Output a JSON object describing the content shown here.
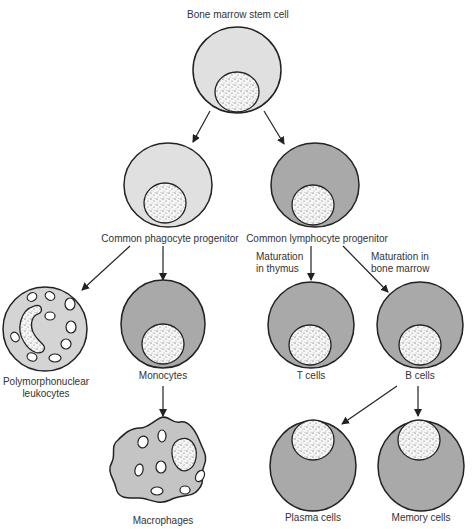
{
  "title": "Bone marrow stem cell",
  "colors": {
    "light_cell": "#e0e0e0",
    "dark_cell": "#a9a9a9",
    "outline": "#222222",
    "nucleus": "#f4f4f4"
  },
  "nodes": {
    "stem": {
      "label": "Bone marrow stem cell"
    },
    "phagocyte": {
      "label": "Common phagocyte progenitor"
    },
    "lymphocyte": {
      "label": "Common lymphocyte progenitor"
    },
    "pmn": {
      "label_line1": "Polymorphonuclear",
      "label_line2": "leukocytes"
    },
    "monocytes": {
      "label": "Monocytes"
    },
    "tcells": {
      "label": "T cells"
    },
    "bcells": {
      "label": "B cells"
    },
    "macrophages": {
      "label": "Macrophages"
    },
    "plasma": {
      "label": "Plasma cells"
    },
    "memory": {
      "label": "Memory cells"
    }
  },
  "edge_labels": {
    "thymus_line1": "Maturation",
    "thymus_line2": "in thymus",
    "marrow_line1": "Maturation in",
    "marrow_line2": "bone marrow"
  }
}
